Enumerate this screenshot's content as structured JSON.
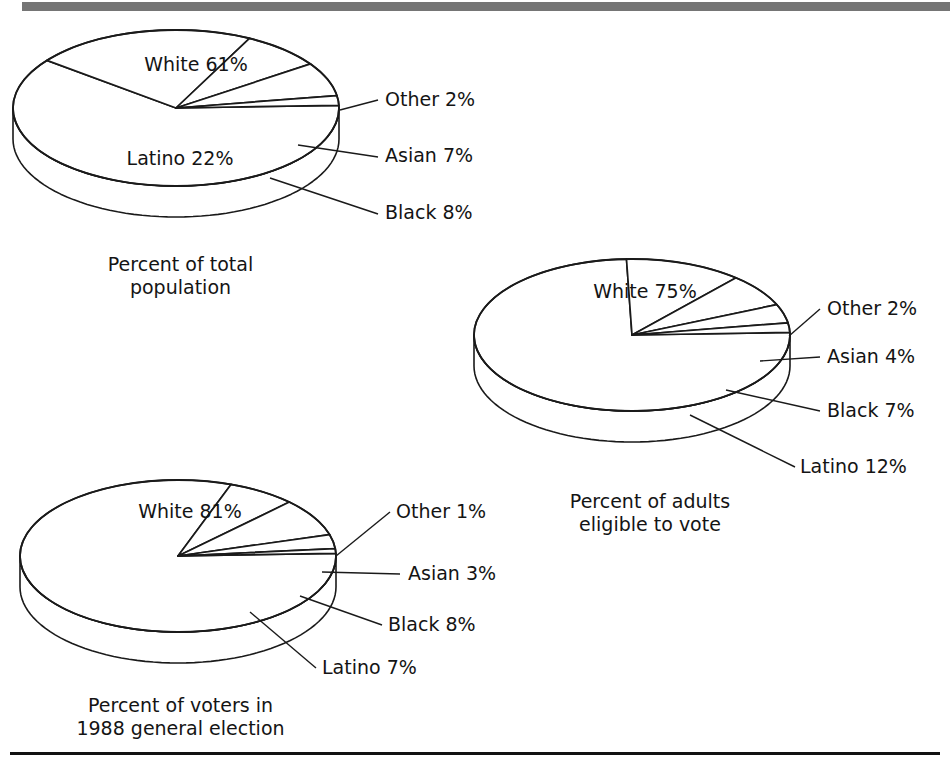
{
  "figure": {
    "background_color": "#ffffff",
    "top_rule_color": "#757575",
    "bottom_rule_color": "#111111"
  },
  "palette": {
    "white_top": "#ffffff",
    "white_side": "#ffffff",
    "latino_top": "#ffffff",
    "latino_side": "#c9c9c9",
    "black_top": "#ffffff",
    "black_side": "#9b9b9b",
    "asian_top": "#ffffff",
    "asian_side": "#9b9b9b",
    "other_top": "#ffffff",
    "other_side": "#ffffff",
    "outline": "#1a1a1a",
    "leader": "#1a1a1a"
  },
  "chart_data": [
    {
      "type": "pie",
      "id": "total-population",
      "title": "Percent of total population",
      "caption_lines": [
        "Percent of total",
        "population"
      ],
      "categories": [
        "White",
        "Latino",
        "Black",
        "Asian",
        "Other"
      ],
      "values": [
        61,
        22,
        8,
        7,
        2
      ],
      "labels": [
        "White 61%",
        "Latino 22%",
        "Black 8%",
        "Asian 7%",
        "Other 2%"
      ],
      "inside_labels": [
        {
          "text": "White 61%",
          "x": 196,
          "y": 71
        },
        {
          "text": "Latino 22%",
          "x": 180,
          "y": 165
        }
      ],
      "leader_labels": [
        {
          "text": "Other 2%",
          "x": 385,
          "y": 106
        },
        {
          "text": "Asian 7%",
          "x": 385,
          "y": 162
        },
        {
          "text": "Black 8%",
          "x": 385,
          "y": 219
        }
      ]
    },
    {
      "type": "pie",
      "id": "adults-eligible",
      "title": "Percent of adults eligible to vote",
      "caption_lines": [
        "Percent of adults",
        "eligible to vote"
      ],
      "categories": [
        "White",
        "Latino",
        "Black",
        "Asian",
        "Other"
      ],
      "values": [
        75,
        12,
        7,
        4,
        2
      ],
      "labels": [
        "White 75%",
        "Latino 12%",
        "Black 7%",
        "Asian 4%",
        "Other 2%"
      ],
      "inside_labels": [
        {
          "text": "White 75%",
          "x": 645,
          "y": 298
        }
      ],
      "leader_labels": [
        {
          "text": "Other 2%",
          "x": 827,
          "y": 315
        },
        {
          "text": "Asian 4%",
          "x": 827,
          "y": 363
        },
        {
          "text": "Black 7%",
          "x": 827,
          "y": 417
        },
        {
          "text": "Latino 12%",
          "x": 800,
          "y": 473
        }
      ]
    },
    {
      "type": "pie",
      "id": "voters-1988",
      "title": "Percent of voters in 1988 general election",
      "caption_lines": [
        "Percent of voters in",
        "1988 general election"
      ],
      "categories": [
        "White",
        "Latino",
        "Black",
        "Asian",
        "Other"
      ],
      "values": [
        81,
        7,
        8,
        3,
        1
      ],
      "labels": [
        "White 81%",
        "Latino 7%",
        "Black 8%",
        "Asian 3%",
        "Other 1%"
      ],
      "inside_labels": [
        {
          "text": "White 81%",
          "x": 190,
          "y": 518
        }
      ],
      "leader_labels": [
        {
          "text": "Other 1%",
          "x": 396,
          "y": 518
        },
        {
          "text": "Asian 3%",
          "x": 408,
          "y": 580
        },
        {
          "text": "Black 8%",
          "x": 388,
          "y": 631
        },
        {
          "text": "Latino 7%",
          "x": 322,
          "y": 674
        }
      ]
    }
  ],
  "captions": {
    "total_population": "Percent of total\npopulation",
    "adults_eligible": "Percent of adults\neligible to vote",
    "voters_1988": "Percent of voters in\n1988 general election"
  }
}
